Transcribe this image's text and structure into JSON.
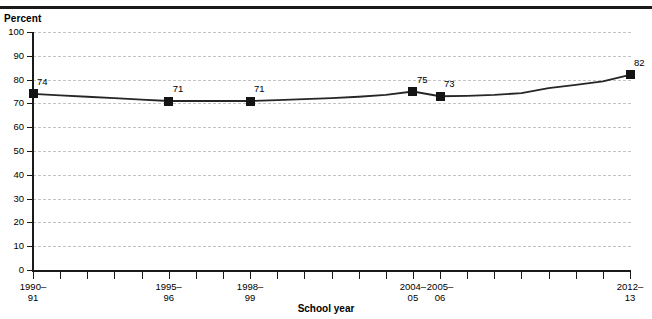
{
  "chart_data": {
    "type": "line",
    "title": "",
    "xlabel": "School year",
    "ylabel": "Percent",
    "ylim": [
      0,
      100
    ],
    "ytick_values": [
      0,
      10,
      20,
      30,
      40,
      50,
      60,
      70,
      80,
      90,
      100
    ],
    "ytick_labels": [
      "0",
      "10",
      "20",
      "30",
      "40",
      "50",
      "60",
      "70",
      "80",
      "90",
      "100"
    ],
    "grid": true,
    "legend": "none",
    "categories": [
      "1990-91",
      "1991-92",
      "1992-93",
      "1993-94",
      "1994-95",
      "1995-96",
      "1996-97",
      "1997-98",
      "1998-99",
      "1999-2000",
      "2000-01",
      "2001-02",
      "2002-03",
      "2003-04",
      "2004-05",
      "2005-06",
      "2006-07",
      "2007-08",
      "2008-09",
      "2009-10",
      "2010-11",
      "2011-12",
      "2012-13"
    ],
    "xtick_labels": [
      {
        "index": 0,
        "line1": "1990–",
        "line2": "91"
      },
      {
        "index": 5,
        "line1": "1995–",
        "line2": "96"
      },
      {
        "index": 8,
        "line1": "1998–",
        "line2": "99"
      },
      {
        "index": 14,
        "line1": "2004–",
        "line2": "05"
      },
      {
        "index": 15,
        "line1": "2005–",
        "line2": "06"
      },
      {
        "index": 22,
        "line1": "2012–",
        "line2": "13"
      }
    ],
    "values": [
      74,
      73.4,
      72.8,
      72.2,
      71.6,
      71,
      71,
      71,
      71,
      71.4,
      71.8,
      72.2,
      72.8,
      73.6,
      75,
      73,
      73.2,
      73.6,
      74.3,
      76.4,
      77.8,
      79.3,
      82
    ],
    "labeled_points": [
      {
        "index": 0,
        "value": 74,
        "label": "74"
      },
      {
        "index": 5,
        "value": 71,
        "label": "71"
      },
      {
        "index": 8,
        "value": 71,
        "label": "71"
      },
      {
        "index": 14,
        "value": 75,
        "label": "75"
      },
      {
        "index": 15,
        "value": 73,
        "label": "73"
      },
      {
        "index": 22,
        "value": 82,
        "label": "82"
      }
    ],
    "marker_style": "filled-square",
    "line_color": "#262626",
    "grid_color": "#c3c3c3"
  }
}
